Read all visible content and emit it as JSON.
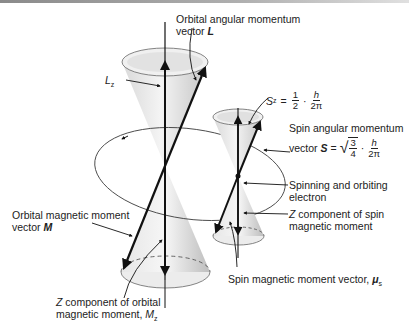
{
  "diagram": {
    "type": "vector-precession-diagram",
    "labels": {
      "orbital_angular_momentum_line1": "Orbital angular momentum",
      "orbital_angular_momentum_line2": "vector",
      "orbital_angular_momentum_symbol": "L",
      "lz": "L",
      "lz_sub": "z",
      "sz_lhs": "S",
      "sz_sub": "z",
      "sz_eq": "=",
      "sz_frac1_num": "1",
      "sz_frac1_den": "2",
      "sz_dot": "·",
      "sz_frac2_num": "h",
      "sz_frac2_den": "2π",
      "spin_angular_momentum_line1": "Spin angular momentum",
      "spin_angular_momentum_line2": "vector",
      "spin_symbol": "S",
      "spin_eq": "=",
      "spin_sqrt_num": "3",
      "spin_sqrt_den": "4",
      "spin_dot": "·",
      "spin_frac_num": "h",
      "spin_frac_den": "2π",
      "electron_line1": "Spinning and orbiting",
      "electron_line2": "electron",
      "z_spin_line1": "Z component of spin",
      "z_spin_line2": "magnetic moment",
      "orbital_magnetic_line1": "Orbital magnetic moment",
      "orbital_magnetic_line2": "vector",
      "orbital_magnetic_symbol": "M",
      "spin_magnetic_text": "Spin magnetic moment vector,",
      "spin_magnetic_symbol": "μ",
      "spin_magnetic_sub": "s",
      "z_orbital_line1": "Z component of orbital",
      "z_orbital_line2": "magnetic moment,",
      "z_orbital_symbol": "M",
      "z_orbital_sub": "z"
    },
    "colors": {
      "line": "#111111",
      "cone_light": "#f2f2f2",
      "cone_dark": "#c8c8c8",
      "text": "#222222"
    }
  }
}
